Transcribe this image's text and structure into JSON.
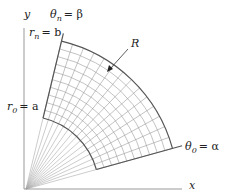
{
  "diagram": {
    "type": "polar-region-grid",
    "origin": {
      "x": 26,
      "y": 189
    },
    "inner_radius_px": 73,
    "outer_radius_px": 152,
    "alpha_deg": 15.5,
    "beta_deg": 76.5,
    "angular_divisions": 14,
    "radial_divisions": 10,
    "colors": {
      "axis": "#999999",
      "grid": "#9a9a9a",
      "boundary": "#555555",
      "ray": "#aaaaaa",
      "text": "#222222"
    }
  },
  "labels": {
    "y_axis": "y",
    "x_axis": "x",
    "theta_n": {
      "symbol": "θ",
      "sub": "n",
      "rhs": "= β"
    },
    "r_n": {
      "symbol": "r",
      "sub": "n",
      "rhs": "= b"
    },
    "r_0": {
      "symbol": "r",
      "sub": "0",
      "rhs": "= a"
    },
    "theta_0": {
      "symbol": "θ",
      "sub": "0",
      "rhs": "= α"
    },
    "region": "R"
  }
}
